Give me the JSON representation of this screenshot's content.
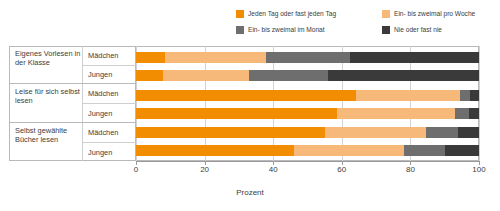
{
  "chart_data": {
    "type": "bar",
    "orientation": "horizontal",
    "stacked": true,
    "title": "",
    "xlabel": "Prozent",
    "ylabel": "",
    "xlim": [
      0,
      100
    ],
    "xticks": [
      0,
      20,
      40,
      60,
      80,
      100
    ],
    "grid": true,
    "legend_position": "top-right",
    "legend": [
      {
        "label": "Jeden Tag oder fast jeden Tag",
        "color": "#F28C00"
      },
      {
        "label": "Ein- bis zweimal pro Woche",
        "color": "#F7B97A"
      },
      {
        "label": "Ein- bis zweimal im Monat",
        "color": "#6E6E6E"
      },
      {
        "label": "Nie oder fast nie",
        "color": "#3A3A3A"
      }
    ],
    "groups": [
      {
        "title": "Eigenes Vorlesen in der Klasse",
        "rows": [
          {
            "label": "Mädchen",
            "values": [
              8.5,
              29.5,
              24.5,
              37.5
            ]
          },
          {
            "label": "Jungen",
            "values": [
              8.0,
              25.0,
              23.0,
              44.0
            ]
          }
        ]
      },
      {
        "title": "Leise für sich selbst lesen",
        "rows": [
          {
            "label": "Mädchen",
            "values": [
              64.0,
              30.5,
              3.0,
              2.5
            ]
          },
          {
            "label": "Jungen",
            "values": [
              58.5,
              34.5,
              4.0,
              3.0
            ]
          }
        ]
      },
      {
        "title": "Selbst gewählte Bücher lesen",
        "rows": [
          {
            "label": "Mädchen",
            "values": [
              55.0,
              29.5,
              9.5,
              6.0
            ]
          },
          {
            "label": "Jungen",
            "values": [
              46.0,
              32.0,
              12.0,
              10.0
            ]
          }
        ]
      }
    ]
  },
  "axis": {
    "ticks": [
      "0",
      "20",
      "40",
      "60",
      "80",
      "100"
    ],
    "xlabel": "Prozent"
  },
  "legend": {
    "items": [
      {
        "label": "Jeden Tag oder fast jeden Tag"
      },
      {
        "label": "Ein- bis zweimal pro Woche"
      },
      {
        "label": "Ein- bis zweimal im Monat"
      },
      {
        "label": "Nie oder fast nie"
      }
    ]
  },
  "groups": [
    {
      "title": "Eigenes Vorlesen in der Klasse",
      "rows": [
        "Mädchen",
        "Jungen"
      ]
    },
    {
      "title": "Leise für sich selbst lesen",
      "rows": [
        "Mädchen",
        "Jungen"
      ]
    },
    {
      "title": "Selbst gewählte Bücher lesen",
      "rows": [
        "Mädchen",
        "Jungen"
      ]
    }
  ]
}
